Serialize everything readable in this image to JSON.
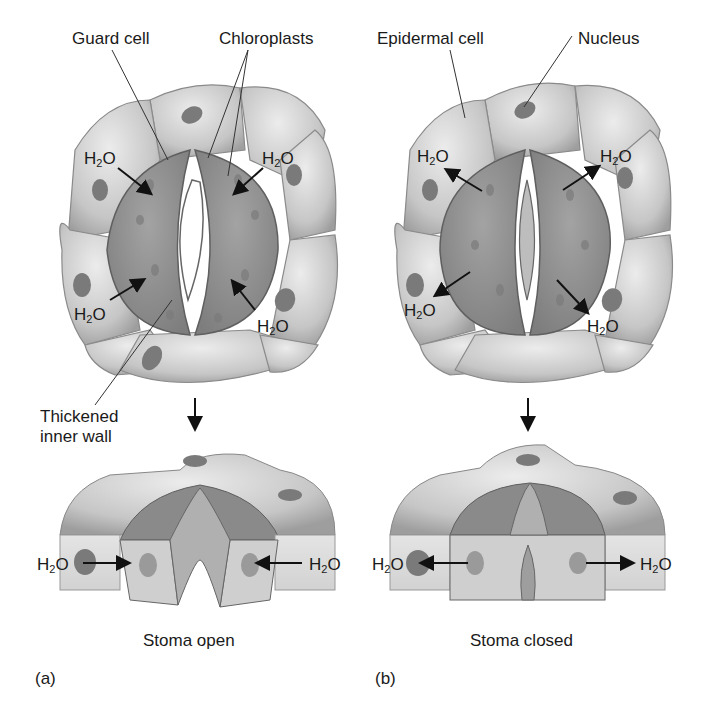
{
  "figure": {
    "panels": [
      {
        "id": "a",
        "letter": "(a)",
        "caption": "Stoma open",
        "labels": {
          "guard_cell": "Guard cell",
          "chloroplasts": "Chloroplasts",
          "thickened_inner_wall_line1": "Thickened",
          "thickened_inner_wall_line2": "inner wall"
        },
        "water_flow": "into guard cells"
      },
      {
        "id": "b",
        "letter": "(b)",
        "caption": "Stoma closed",
        "labels": {
          "epidermal_cell": "Epidermal cell",
          "nucleus": "Nucleus"
        },
        "water_flow": "out of guard cells"
      }
    ],
    "water": {
      "base": "H",
      "sub": "2",
      "tail": "O"
    },
    "colors": {
      "epidermal_cell": "#c9c9c9",
      "guard_cell": "#8e8e8e",
      "nucleus": "#7a7a7a",
      "pore": "#ffffff",
      "arrow": "#111111"
    }
  }
}
